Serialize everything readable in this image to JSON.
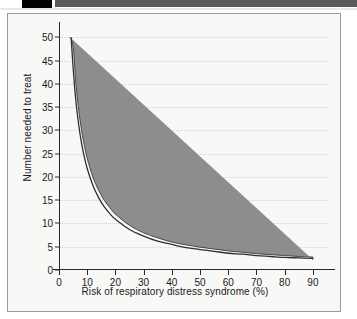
{
  "topbar": {
    "black_block_label": "black-marker",
    "gray_bar_label": "gray-header-bar"
  },
  "chart_data": {
    "type": "line",
    "title": "",
    "xlabel": "Risk of respiratory distress syndrome (%)",
    "ylabel": "Number needed to treat",
    "xlim": [
      0,
      95
    ],
    "ylim": [
      0,
      52
    ],
    "xticks": [
      0,
      10,
      20,
      30,
      40,
      50,
      60,
      70,
      80,
      90
    ],
    "yticks": [
      0,
      5,
      10,
      15,
      20,
      25,
      30,
      35,
      40,
      45,
      50
    ],
    "grid": "horizontal-dotted",
    "legend": "none",
    "series": [
      {
        "name": "Number needed to treat",
        "x": [
          4.3,
          5,
          6,
          7,
          8,
          9,
          10,
          12,
          14,
          16,
          18,
          20,
          25,
          30,
          35,
          40,
          45,
          50,
          55,
          60,
          65,
          70,
          75,
          80,
          85,
          90
        ],
        "values": [
          50.0,
          43.5,
          36.2,
          31.1,
          27.2,
          24.2,
          21.8,
          18.2,
          15.6,
          13.6,
          12.1,
          10.9,
          8.7,
          7.3,
          6.2,
          5.5,
          4.8,
          4.4,
          4.0,
          3.6,
          3.4,
          3.1,
          2.9,
          2.7,
          2.6,
          2.5
        ]
      },
      {
        "name": "Upper confidence limit",
        "x": [
          3.9,
          5,
          6,
          7,
          8,
          9,
          10,
          12,
          14,
          16,
          18,
          20,
          25,
          30,
          35,
          40,
          45,
          50,
          55,
          60,
          65,
          70,
          75,
          80,
          85,
          90
        ],
        "values": [
          50.0,
          48.0,
          40.0,
          34.3,
          30.0,
          26.7,
          24.0,
          20.0,
          17.2,
          15.0,
          13.4,
          12.0,
          9.6,
          8.0,
          6.9,
          6.0,
          5.4,
          4.9,
          4.5,
          4.1,
          3.8,
          3.5,
          3.3,
          3.1,
          2.9,
          2.8
        ]
      },
      {
        "name": "Lower confidence limit",
        "x": [
          4.9,
          6,
          7,
          8,
          9,
          10,
          12,
          14,
          16,
          18,
          20,
          25,
          30,
          35,
          40,
          45,
          50,
          55,
          60,
          65,
          70,
          75,
          80,
          85,
          90
        ],
        "values": [
          50.0,
          40.8,
          35.0,
          30.6,
          27.2,
          24.5,
          20.4,
          17.5,
          15.3,
          13.6,
          12.2,
          9.8,
          8.2,
          7.0,
          6.1,
          5.4,
          4.9,
          4.5,
          4.1,
          3.8,
          3.5,
          3.3,
          3.1,
          2.9,
          2.2
        ]
      }
    ],
    "band_color": "#8d8d8b",
    "line_color": "#3a3a3a"
  }
}
